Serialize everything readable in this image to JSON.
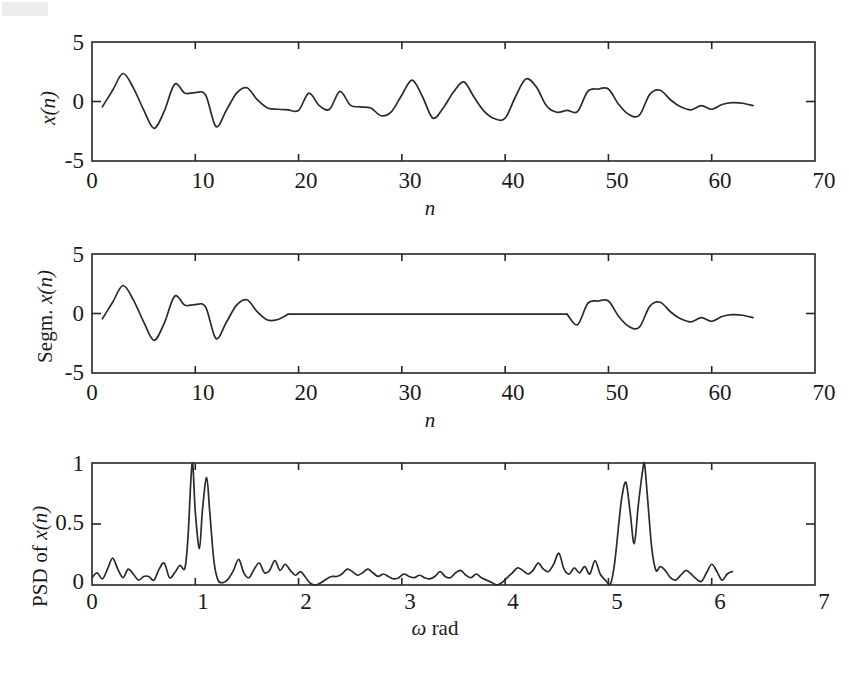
{
  "figure": {
    "background": "#ffffff",
    "line_color": "#2b2b2b",
    "axis_color": "#262626"
  },
  "panels": [
    {
      "id": "signal",
      "ylabel_plain": "",
      "ylabel_italic": "x(n)",
      "xlabel_plain": "",
      "xlabel_italic": "n",
      "yticks": [
        "5",
        "0",
        "-5"
      ],
      "xticks": [
        "0",
        "10",
        "20",
        "30",
        "40",
        "50",
        "60",
        "70"
      ]
    },
    {
      "id": "segmented-signal",
      "ylabel_plain": "Segm. ",
      "ylabel_italic": "x(n)",
      "xlabel_plain": "",
      "xlabel_italic": "n",
      "yticks": [
        "5",
        "0",
        "-5"
      ],
      "xticks": [
        "0",
        "10",
        "20",
        "30",
        "40",
        "50",
        "60",
        "70"
      ]
    },
    {
      "id": "psd",
      "ylabel_plain": "PSD of ",
      "ylabel_italic": "x(n)",
      "xlabel_plain": " rad",
      "xlabel_italic": "ω",
      "yticks": [
        "1",
        "0.5",
        "0"
      ],
      "xticks": [
        "0",
        "1",
        "2",
        "3",
        "4",
        "5",
        "6",
        "7"
      ]
    }
  ],
  "chart_data": [
    {
      "type": "line",
      "id": "signal",
      "title": "",
      "xlabel": "n",
      "ylabel": "x(n)",
      "xlim": [
        0,
        70
      ],
      "ylim": [
        -5,
        5
      ],
      "xticks": [
        0,
        10,
        20,
        30,
        40,
        50,
        60,
        70
      ],
      "yticks": [
        -5,
        0,
        5
      ],
      "grid": false,
      "legend": "none",
      "x": [
        1,
        2,
        3,
        4,
        5,
        6,
        7,
        8,
        9,
        10,
        11,
        12,
        13,
        14,
        15,
        16,
        17,
        18,
        19,
        20,
        21,
        22,
        23,
        24,
        25,
        26,
        27,
        28,
        29,
        30,
        31,
        32,
        33,
        34,
        35,
        36,
        37,
        38,
        39,
        40,
        41,
        42,
        43,
        44,
        45,
        46,
        47,
        48,
        49,
        50,
        51,
        52,
        53,
        54,
        55,
        56,
        57,
        58,
        59,
        60,
        61,
        62,
        63,
        64
      ],
      "y": [
        -0.45,
        0.95,
        2.35,
        1.15,
        -0.7,
        -2.25,
        -0.8,
        1.45,
        0.7,
        0.75,
        0.55,
        -2.1,
        -0.75,
        0.7,
        1.15,
        0.15,
        -0.55,
        -0.65,
        -0.7,
        -0.75,
        0.7,
        -0.35,
        -0.65,
        0.85,
        -0.3,
        -0.45,
        -0.55,
        -1.2,
        -0.85,
        0.55,
        1.8,
        0.4,
        -1.4,
        -0.55,
        0.8,
        1.65,
        0.35,
        -0.85,
        -1.45,
        -1.4,
        0.4,
        1.9,
        1.25,
        -0.35,
        -0.9,
        -0.75,
        -0.85,
        0.85,
        1.05,
        1.05,
        -0.25,
        -1.1,
        -1.15,
        0.6,
        0.95,
        0.15,
        -0.45,
        -0.7,
        -0.35,
        -0.65,
        -0.25,
        -0.1,
        -0.15,
        -0.35
      ]
    },
    {
      "type": "line",
      "id": "segmented-signal",
      "title": "",
      "xlabel": "n",
      "ylabel": "Segm. x(n)",
      "xlim": [
        0,
        70
      ],
      "ylim": [
        -5,
        5
      ],
      "xticks": [
        0,
        10,
        20,
        30,
        40,
        50,
        60,
        70
      ],
      "yticks": [
        -5,
        0,
        5
      ],
      "grid": false,
      "legend": "none",
      "segments": [
        {
          "name": "first-segment",
          "x": [
            1,
            2,
            3,
            4,
            5,
            6,
            7,
            8,
            9,
            10,
            11,
            12,
            13,
            14,
            15,
            16,
            17,
            18,
            19
          ],
          "y": [
            -0.45,
            0.95,
            2.35,
            1.15,
            -0.7,
            -2.25,
            -0.8,
            1.45,
            0.7,
            0.75,
            0.55,
            -2.1,
            -0.75,
            0.7,
            1.15,
            0.15,
            -0.55,
            -0.5,
            -0.05
          ]
        },
        {
          "name": "zero-gap",
          "x": [
            19,
            46
          ],
          "y": [
            -0.05,
            -0.05
          ]
        },
        {
          "name": "second-segment",
          "x": [
            46,
            47,
            48,
            49,
            50,
            51,
            52,
            53,
            54,
            55,
            56,
            57,
            58,
            59,
            60,
            61,
            62,
            63,
            64
          ],
          "y": [
            -0.05,
            -0.95,
            0.85,
            1.05,
            1.05,
            -0.25,
            -1.1,
            -1.15,
            0.6,
            0.95,
            0.15,
            -0.45,
            -0.7,
            -0.35,
            -0.65,
            -0.25,
            -0.1,
            -0.15,
            -0.35
          ]
        }
      ]
    },
    {
      "type": "line",
      "id": "psd",
      "title": "",
      "xlabel": "ω rad",
      "ylabel": "PSD of x(n)",
      "xlim": [
        0,
        7
      ],
      "ylim": [
        0,
        1
      ],
      "xticks": [
        0,
        1,
        2,
        3,
        4,
        5,
        6,
        7
      ],
      "yticks": [
        0,
        0.5,
        1
      ],
      "grid": false,
      "legend": "none",
      "peaks": [
        {
          "omega": 0.97,
          "value": 1.0
        },
        {
          "omega": 1.11,
          "value": 0.88
        },
        {
          "omega": 5.17,
          "value": 0.84
        },
        {
          "omega": 5.35,
          "value": 0.99
        }
      ],
      "x": [
        0.0,
        0.05,
        0.1,
        0.15,
        0.2,
        0.25,
        0.3,
        0.35,
        0.4,
        0.45,
        0.5,
        0.55,
        0.6,
        0.65,
        0.7,
        0.75,
        0.8,
        0.85,
        0.9,
        0.93,
        0.97,
        1.0,
        1.04,
        1.07,
        1.11,
        1.14,
        1.18,
        1.22,
        1.27,
        1.32,
        1.37,
        1.42,
        1.47,
        1.52,
        1.57,
        1.62,
        1.67,
        1.72,
        1.77,
        1.82,
        1.87,
        1.92,
        1.97,
        2.02,
        2.07,
        2.12,
        2.17,
        2.22,
        2.27,
        2.32,
        2.37,
        2.42,
        2.47,
        2.52,
        2.57,
        2.62,
        2.67,
        2.72,
        2.77,
        2.82,
        2.87,
        2.92,
        2.97,
        3.02,
        3.07,
        3.12,
        3.17,
        3.22,
        3.27,
        3.32,
        3.37,
        3.42,
        3.47,
        3.52,
        3.57,
        3.62,
        3.67,
        3.72,
        3.77,
        3.82,
        3.87,
        3.92,
        3.97,
        4.02,
        4.07,
        4.12,
        4.17,
        4.22,
        4.27,
        4.32,
        4.37,
        4.42,
        4.47,
        4.52,
        4.57,
        4.62,
        4.67,
        4.72,
        4.77,
        4.82,
        4.87,
        4.92,
        4.97,
        5.02,
        5.06,
        5.1,
        5.13,
        5.17,
        5.21,
        5.25,
        5.29,
        5.33,
        5.35,
        5.38,
        5.42,
        5.46,
        5.5,
        5.55,
        5.6,
        5.65,
        5.7,
        5.75,
        5.8,
        5.85,
        5.9,
        5.95,
        6.0,
        6.05,
        6.1,
        6.15,
        6.2,
        6.25,
        6.28
      ],
      "y": [
        0.06,
        0.1,
        0.05,
        0.13,
        0.22,
        0.13,
        0.06,
        0.13,
        0.09,
        0.04,
        0.07,
        0.07,
        0.04,
        0.13,
        0.18,
        0.06,
        0.1,
        0.16,
        0.14,
        0.4,
        1.0,
        0.6,
        0.3,
        0.62,
        0.88,
        0.6,
        0.2,
        0.04,
        0.02,
        0.05,
        0.12,
        0.21,
        0.1,
        0.06,
        0.13,
        0.18,
        0.1,
        0.12,
        0.2,
        0.12,
        0.17,
        0.12,
        0.08,
        0.11,
        0.06,
        0.01,
        0.0,
        0.02,
        0.05,
        0.07,
        0.07,
        0.09,
        0.13,
        0.11,
        0.08,
        0.1,
        0.13,
        0.1,
        0.07,
        0.09,
        0.07,
        0.05,
        0.06,
        0.09,
        0.07,
        0.06,
        0.08,
        0.06,
        0.05,
        0.07,
        0.11,
        0.07,
        0.06,
        0.1,
        0.12,
        0.08,
        0.06,
        0.09,
        0.06,
        0.04,
        0.02,
        0.0,
        0.02,
        0.06,
        0.1,
        0.14,
        0.12,
        0.09,
        0.12,
        0.18,
        0.13,
        0.11,
        0.17,
        0.26,
        0.13,
        0.09,
        0.14,
        0.1,
        0.15,
        0.09,
        0.2,
        0.09,
        0.04,
        0.01,
        0.18,
        0.5,
        0.72,
        0.84,
        0.6,
        0.34,
        0.66,
        0.93,
        0.99,
        0.7,
        0.3,
        0.12,
        0.15,
        0.12,
        0.06,
        0.04,
        0.08,
        0.12,
        0.09,
        0.05,
        0.03,
        0.1,
        0.17,
        0.11,
        0.04,
        0.09,
        0.11,
        0.08
      ]
    }
  ]
}
